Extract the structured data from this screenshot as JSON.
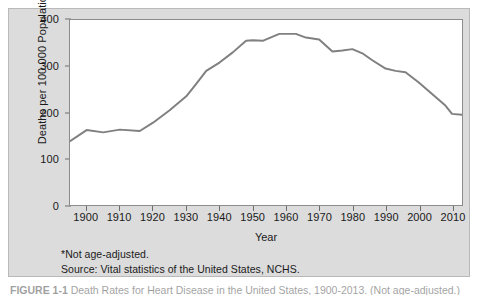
{
  "figure": {
    "panel_background": "#dcdcdc",
    "plot_background": "#ffffff",
    "line_color": "#808080",
    "axis_color": "#6e6e6e"
  },
  "axes": {
    "y_title": "Deaths per 100,000 Population",
    "x_title": "Year",
    "y_ticks": [
      0,
      100,
      200,
      300,
      400
    ],
    "y_tick_labels": [
      "0",
      "100",
      "200",
      "300",
      "400"
    ],
    "x_ticks": [
      1900,
      1910,
      1920,
      1930,
      1940,
      1950,
      1960,
      1970,
      1980,
      1990,
      2000,
      2010
    ],
    "x_tick_labels": [
      "1900",
      "1910",
      "1920",
      "1930",
      "1940",
      "1950",
      "1960",
      "1970",
      "1980",
      "1990",
      "2000",
      "2010"
    ]
  },
  "footnotes": {
    "line1": "*Not age-adjusted.",
    "line2": "Source: Vital statistics of the United States, NCHS."
  },
  "caption": {
    "label": "FIGURE 1-1",
    "text": "Death Rates for Heart Disease in the United States, 1900-2013. (Not age-adjusted.)"
  },
  "chart_data": {
    "type": "line",
    "title": "",
    "subtitle": "",
    "xlabel": "Year",
    "ylabel": "Deaths per 100,000 Population",
    "xlim": [
      1895,
      2013
    ],
    "ylim": [
      0,
      400
    ],
    "grid": false,
    "legend": null,
    "annotations": [
      "*Not age-adjusted.",
      "Source: Vital statistics of the United States, NCHS."
    ],
    "series": [
      {
        "name": "Deaths per 100,000 Population",
        "color": "#808080",
        "x": [
          1895,
          1900,
          1905,
          1910,
          1916,
          1920,
          1925,
          1930,
          1933,
          1936,
          1940,
          1944,
          1948,
          1950,
          1953,
          1958,
          1960,
          1963,
          1966,
          1970,
          1974,
          1977,
          1980,
          1983,
          1986,
          1990,
          1993,
          1996,
          2000,
          2004,
          2008,
          2010,
          2013
        ],
        "y": [
          138,
          162,
          157,
          163,
          160,
          178,
          205,
          235,
          262,
          290,
          308,
          330,
          355,
          356,
          355,
          370,
          370,
          370,
          362,
          358,
          332,
          334,
          337,
          328,
          313,
          295,
          290,
          287,
          265,
          240,
          215,
          197,
          195
        ]
      }
    ]
  }
}
